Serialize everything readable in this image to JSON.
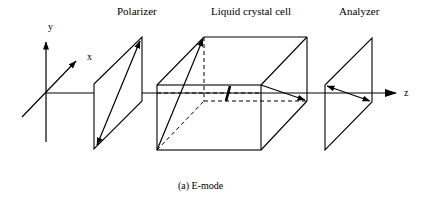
{
  "labels": {
    "polarizer": "Polarizer",
    "lc_cell": "Liquid crystal cell",
    "analyzer": "Analyzer",
    "axis_x": "x",
    "axis_y": "y",
    "axis_z": "z",
    "caption": "(a) E-mode"
  },
  "colors": {
    "stroke": "#000000",
    "background": "#ffffff"
  }
}
